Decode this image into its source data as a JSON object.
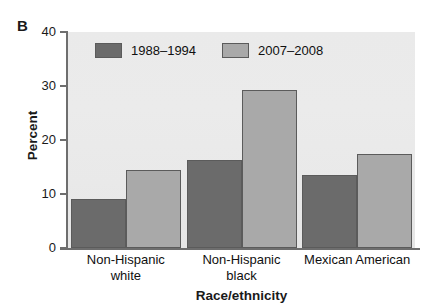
{
  "panel": {
    "letter": "B"
  },
  "chart_data": {
    "type": "bar",
    "title": "",
    "xlabel": "Race/ethnicity",
    "ylabel": "Percent",
    "categories": [
      "Non-Hispanic white",
      "Non-Hispanic black",
      "Mexican American"
    ],
    "category_lines": [
      [
        "Non-Hispanic",
        "white"
      ],
      [
        "Non-Hispanic",
        "black"
      ],
      [
        "Mexican American",
        ""
      ]
    ],
    "series": [
      {
        "name": "1988–1994",
        "color": "#6b6b6b",
        "values": [
          9.1,
          16.3,
          13.5
        ]
      },
      {
        "name": "2007–2008",
        "color": "#a9a9a9",
        "values": [
          14.5,
          29.2,
          17.4
        ]
      }
    ],
    "ylim": [
      0,
      40
    ],
    "yticks": [
      0,
      10,
      20,
      30,
      40
    ],
    "ytick_labels": [
      "0",
      "10",
      "20",
      "30",
      "40"
    ],
    "grid": false,
    "legend_position": "top-left-inside",
    "plot_background": "#eaeaea"
  }
}
